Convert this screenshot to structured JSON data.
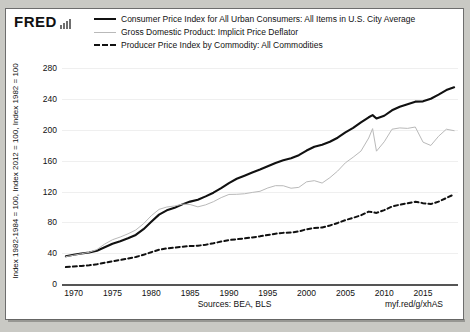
{
  "brand": {
    "name": "FRED",
    "sparkline_icon": "bar-chart-icon"
  },
  "legend": {
    "items": [
      {
        "label": "Consumer Price Index for All Urban Consumers: All Items in U.S. City Average",
        "style": "solid-thick",
        "color": "#111111"
      },
      {
        "label": "Gross Domestic Product: Implicit Price Deflator",
        "style": "solid-thin",
        "color": "#b9b9b9"
      },
      {
        "label": "Producer Price Index by Commodity: All Commodities",
        "style": "dashed",
        "color": "#111111"
      }
    ]
  },
  "axes": {
    "y_title": "Index 1982-1984 = 100, Index 2012 = 100, Index 1982 = 100",
    "y_ticks": [
      0,
      40,
      80,
      120,
      160,
      200,
      240,
      280
    ],
    "x_ticks": [
      1970,
      1975,
      1980,
      1985,
      1990,
      1995,
      2000,
      2005,
      2010,
      2015
    ]
  },
  "footer": {
    "sources": "Sources: BEA, BLS",
    "permalink": "myf.red/g/xhAS"
  },
  "chart_data": {
    "type": "line",
    "title": "",
    "xlabel": "",
    "ylabel": "Index 1982-1984 = 100, Index 2012 = 100, Index 1982 = 100",
    "xlim": [
      1968.5,
      2019.5
    ],
    "ylim": [
      0,
      300
    ],
    "grid": true,
    "legend_position": "top",
    "series": [
      {
        "name": "Consumer Price Index for All Urban Consumers: All Items in U.S. City Average",
        "color": "#111111",
        "style": "solid-thick",
        "x": [
          1969,
          1970,
          1971,
          1972,
          1973,
          1974,
          1975,
          1976,
          1977,
          1978,
          1979,
          1980,
          1981,
          1982,
          1983,
          1984,
          1985,
          1986,
          1987,
          1988,
          1989,
          1990,
          1991,
          1992,
          1993,
          1994,
          1995,
          1996,
          1997,
          1998,
          1999,
          2000,
          2001,
          2002,
          2003,
          2004,
          2005,
          2006,
          2007,
          2008,
          2008.5,
          2009,
          2010,
          2011,
          2012,
          2013,
          2014,
          2015,
          2016,
          2017,
          2018,
          2019
        ],
        "values": [
          36.0,
          37.9,
          39.6,
          41.0,
          43.2,
          47.8,
          52.3,
          55.5,
          59.4,
          63.7,
          71.2,
          80.8,
          90.1,
          95.7,
          99.1,
          103.4,
          107.0,
          109.5,
          113.8,
          118.6,
          124.4,
          131.1,
          136.7,
          140.7,
          144.8,
          148.6,
          152.8,
          157.2,
          160.8,
          163.4,
          167.3,
          173.3,
          178.2,
          180.9,
          184.7,
          190.0,
          196.9,
          202.7,
          209.8,
          216.5,
          219.3,
          214.9,
          218.5,
          225.6,
          230.2,
          233.5,
          236.8,
          237.2,
          240.6,
          246.0,
          251.8,
          255.5
        ]
      },
      {
        "name": "Gross Domestic Product: Implicit Price Deflator",
        "color": "#b9b9b9",
        "style": "solid-thin",
        "note": "plotted as the light grey volatile series",
        "x": [
          1969,
          1970,
          1971,
          1972,
          1973,
          1974,
          1975,
          1976,
          1977,
          1978,
          1979,
          1980,
          1981,
          1982,
          1983,
          1984,
          1985,
          1986,
          1987,
          1988,
          1989,
          1990,
          1991,
          1992,
          1993,
          1994,
          1995,
          1996,
          1997,
          1998,
          1999,
          2000,
          2001,
          2002,
          2003,
          2004,
          2005,
          2006,
          2007,
          2008,
          2008.5,
          2009,
          2010,
          2011,
          2012,
          2013,
          2014,
          2015,
          2016,
          2017,
          2018,
          2019
        ],
        "values": [
          35.5,
          37.4,
          39.3,
          41.2,
          44.8,
          51.9,
          57.5,
          61.0,
          65.2,
          70.1,
          78.3,
          88.7,
          96.9,
          100.0,
          101.3,
          103.7,
          103.2,
          100.2,
          102.8,
          106.9,
          112.2,
          116.3,
          116.5,
          117.2,
          118.9,
          120.4,
          124.7,
          127.7,
          127.6,
          124.4,
          125.5,
          132.7,
          134.2,
          131.1,
          138.1,
          146.7,
          157.4,
          164.7,
          172.6,
          189.6,
          201.8,
          172.5,
          184.7,
          201.0,
          202.7,
          202.1,
          203.9,
          184.2,
          179.9,
          191.9,
          201.0,
          199.1
        ]
      },
      {
        "name": "Producer Price Index by Commodity: All Commodities",
        "color": "#111111",
        "style": "dashed",
        "note": "plotted as the smooth dashed series",
        "x": [
          1969,
          1970,
          1971,
          1972,
          1973,
          1974,
          1975,
          1976,
          1977,
          1978,
          1979,
          1980,
          1981,
          1982,
          1983,
          1984,
          1985,
          1986,
          1987,
          1988,
          1989,
          1990,
          1991,
          1992,
          1993,
          1994,
          1995,
          1996,
          1997,
          1998,
          1999,
          2000,
          2001,
          2002,
          2003,
          2004,
          2005,
          2006,
          2007,
          2008,
          2009,
          2010,
          2011,
          2012,
          2013,
          2014,
          2015,
          2016,
          2017,
          2018,
          2019
        ],
        "values": [
          22.0,
          22.7,
          23.5,
          24.4,
          25.6,
          27.6,
          29.6,
          31.2,
          33.0,
          35.1,
          37.9,
          41.3,
          44.5,
          46.2,
          47.2,
          48.5,
          49.3,
          49.7,
          51.0,
          52.9,
          55.1,
          57.1,
          58.1,
          59.2,
          60.5,
          61.9,
          63.6,
          65.3,
          66.4,
          66.8,
          68.3,
          71.1,
          72.7,
          73.3,
          75.9,
          79.3,
          83.0,
          86.0,
          89.2,
          94.0,
          92.3,
          96.0,
          100.6,
          103.0,
          104.8,
          106.8,
          105.0,
          103.8,
          107.0,
          111.7,
          116.5
        ]
      }
    ]
  }
}
